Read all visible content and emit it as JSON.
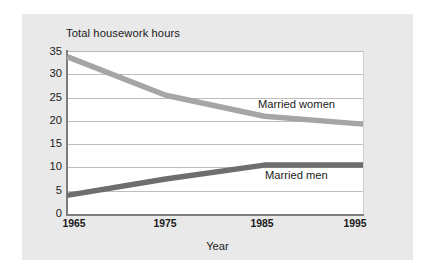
{
  "chart_data": {
    "type": "line",
    "title": "Total housework hours",
    "xlabel": "Year",
    "ylabel": "",
    "x": [
      1965,
      1975,
      1985,
      1995
    ],
    "xtick_labels": [
      "1965",
      "1975",
      "1985",
      "1995"
    ],
    "ytick_labels": [
      "0",
      "5",
      "10",
      "15",
      "20",
      "25",
      "30",
      "35"
    ],
    "yticks": [
      0,
      5,
      10,
      15,
      20,
      25,
      30,
      35
    ],
    "ylim": [
      0,
      35
    ],
    "xlim": [
      1965,
      1995
    ],
    "grid": "horizontal",
    "legend_position": "inline-right",
    "series": [
      {
        "name": "Married women",
        "values": [
          33.8,
          25.5,
          21.0,
          19.3
        ],
        "color": "#a5a5a5"
      },
      {
        "name": "Married men",
        "values": [
          4.0,
          7.5,
          10.5,
          10.5
        ],
        "color": "#6e6e6e"
      }
    ]
  },
  "labels": {
    "title": "Total housework hours",
    "x_axis_title": "Year",
    "series_women": "Married women",
    "series_men": "Married men",
    "y_0": "0",
    "y_5": "5",
    "y_10": "10",
    "y_15": "15",
    "y_20": "20",
    "y_25": "25",
    "y_30": "30",
    "y_35": "35",
    "x_1965": "1965",
    "x_1975": "1975",
    "x_1985": "1985",
    "x_1995": "1995"
  },
  "colors": {
    "page_background": "#ffffff",
    "card_background": "#e9e9e9",
    "plot_background": "#ffffff",
    "gridline": "#bdbdbd",
    "axis": "#7d7d7d",
    "text": "#1a1a1a",
    "series_women": "#a5a5a5",
    "series_men": "#6e6e6e"
  }
}
